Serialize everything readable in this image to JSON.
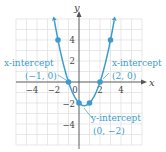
{
  "chart_data": {
    "type": "line",
    "title": "",
    "equation": "y = x^2 - x - 2",
    "xlabel": "x",
    "ylabel": "y",
    "xlim": [
      -6,
      6
    ],
    "ylim": [
      -6,
      6
    ],
    "grid": true,
    "x_ticks": [
      -4,
      -2,
      0,
      2,
      4
    ],
    "y_ticks": [
      4,
      2,
      -2,
      -4
    ],
    "x_tick_labels": [
      "−4",
      "−2",
      "0",
      "2",
      "4"
    ],
    "y_tick_labels": [
      "4",
      "2",
      "−2",
      "−4"
    ],
    "series": [
      {
        "name": "parabola",
        "points": [
          [
            -2,
            4
          ],
          [
            -1,
            0
          ],
          [
            0,
            -2
          ],
          [
            1,
            -2
          ],
          [
            2,
            0
          ],
          [
            3,
            4
          ]
        ],
        "vertex": [
          0.5,
          -2.25
        ]
      }
    ],
    "annotations": [
      {
        "label": "x-intercept",
        "coords": "(−1, 0)",
        "point": [
          -1,
          0
        ]
      },
      {
        "label": "x-intercept",
        "coords": "(2, 0)",
        "point": [
          2,
          0
        ]
      },
      {
        "label": "y-intercept",
        "coords": "(0, −2)",
        "point": [
          0,
          -2
        ]
      }
    ],
    "colors": {
      "curve": "#3d9ccb",
      "axes": "#555555",
      "grid": "#dedede"
    }
  },
  "labels": {
    "x_axis": "x",
    "y_axis": "y",
    "ann_left_title": "x-intercept",
    "ann_left_coords": "(−1, 0)",
    "ann_right_title": "x-intercept",
    "ann_right_coords": "(2, 0)",
    "ann_bottom_title": "y-intercept",
    "ann_bottom_coords": "(0, −2)",
    "tick_x_m4": "−4",
    "tick_x_m2": "−2",
    "tick_x_0": "0",
    "tick_x_2": "2",
    "tick_x_4": "4",
    "tick_y_4": "4",
    "tick_y_2": "2",
    "tick_y_m2": "−2",
    "tick_y_m4": "−4"
  }
}
